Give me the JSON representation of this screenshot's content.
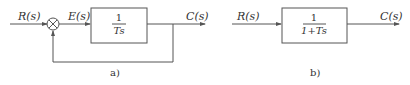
{
  "diagram_a": {
    "caption": "a)",
    "input_label": "R(s)",
    "error_label": "E(s)",
    "output_label": "C(s)",
    "block": {
      "numerator": "1",
      "denominator": "Ts"
    },
    "summing_junction": {
      "feedback_sign": "-"
    },
    "feedback": "unity"
  },
  "diagram_b": {
    "caption": "b)",
    "input_label": "R(s)",
    "output_label": "C(s)",
    "block": {
      "numerator": "1",
      "denominator": "1+Ts"
    }
  },
  "colors": {
    "line": "#555555",
    "text": "#333333",
    "background": "#ffffff"
  }
}
